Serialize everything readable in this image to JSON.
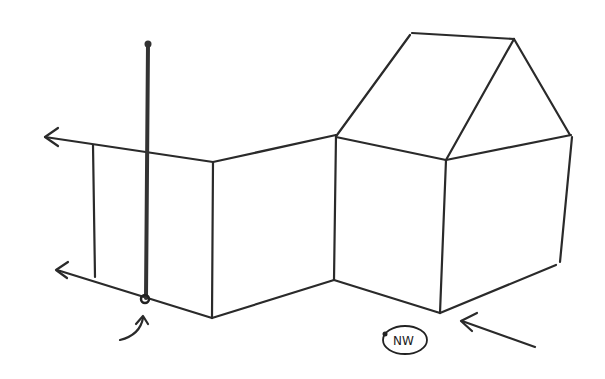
{
  "diagram": {
    "type": "hand-drawn isometric sketch",
    "compass_label": "NW",
    "colors": {
      "stroke": "#2a2a2a",
      "background": "#ffffff"
    },
    "elements": [
      "left-arrow-top",
      "left-arrow-bottom",
      "vertical-pole",
      "pole-base-marker",
      "curved-pointer-arrow",
      "left-wall-panel",
      "middle-wall-panel",
      "house-front-wall",
      "house-side-wall",
      "gabled-roof",
      "nw-direction-arrow",
      "nw-compass-badge"
    ]
  }
}
